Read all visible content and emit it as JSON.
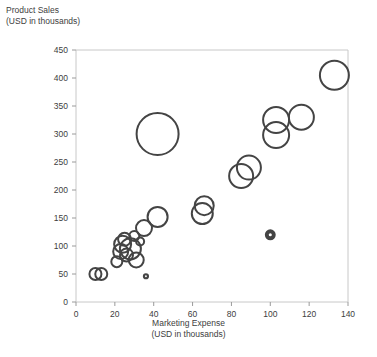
{
  "chart_data": {
    "type": "scatter",
    "title": "",
    "xlabel": "Marketing Expense (USD in thousands)",
    "ylabel": "Product Sales (USD in thousands)",
    "xlabel_lines": [
      "Marketing Expense",
      "(USD in thousands)"
    ],
    "ylabel_lines": [
      "Product Sales",
      "(USD in thousands)"
    ],
    "xlim": [
      0,
      140
    ],
    "ylim": [
      0,
      450
    ],
    "xticks": [
      0,
      20,
      40,
      60,
      80,
      100,
      120,
      140
    ],
    "yticks": [
      0,
      50,
      100,
      150,
      200,
      250,
      300,
      350,
      400,
      450
    ],
    "grid": false,
    "legend": "none",
    "marker_style": "open-circle",
    "marker_color": "#444444",
    "bubble_size_encodes": "third variable (bubble area)",
    "points": [
      {
        "x": 10,
        "y": 50,
        "r": 6.0
      },
      {
        "x": 13,
        "y": 50,
        "r": 6.0
      },
      {
        "x": 21,
        "y": 72,
        "r": 5.5
      },
      {
        "x": 23,
        "y": 90,
        "r": 7.5
      },
      {
        "x": 24,
        "y": 103,
        "r": 8.5
      },
      {
        "x": 25,
        "y": 112,
        "r": 6.5
      },
      {
        "x": 26,
        "y": 84,
        "r": 6.5
      },
      {
        "x": 28,
        "y": 95,
        "r": 10.5
      },
      {
        "x": 30,
        "y": 118,
        "r": 5.0
      },
      {
        "x": 31,
        "y": 75,
        "r": 7.5
      },
      {
        "x": 33,
        "y": 108,
        "r": 4.0
      },
      {
        "x": 35,
        "y": 132,
        "r": 8.0
      },
      {
        "x": 36,
        "y": 46,
        "r": 2.0
      },
      {
        "x": 42,
        "y": 152,
        "r": 10.0
      },
      {
        "x": 42,
        "y": 300,
        "r": 21.0
      },
      {
        "x": 65,
        "y": 158,
        "r": 10.5
      },
      {
        "x": 66,
        "y": 172,
        "r": 9.5
      },
      {
        "x": 85,
        "y": 225,
        "r": 12.0
      },
      {
        "x": 89,
        "y": 240,
        "r": 12.0
      },
      {
        "x": 100,
        "y": 120,
        "r": 3.5
      },
      {
        "x": 103,
        "y": 298,
        "r": 13.0
      },
      {
        "x": 103,
        "y": 325,
        "r": 13.0
      },
      {
        "x": 116,
        "y": 330,
        "r": 12.5
      },
      {
        "x": 133,
        "y": 405,
        "r": 14.5
      }
    ]
  },
  "colors": {
    "marker": "#444444",
    "frame": "#c8c8c8",
    "text": "#404040",
    "background": "#ffffff"
  }
}
